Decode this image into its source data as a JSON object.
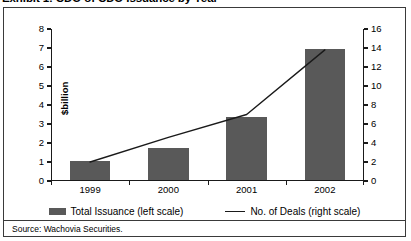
{
  "exhibit": {
    "title": "Exhibit 1: CDO of CDO Issuance by Year",
    "source": "Source: Wachovia Securities."
  },
  "chart_data": {
    "type": "bar",
    "title": "Exhibit 1: CDO of CDO Issuance by Year",
    "categories": [
      "1999",
      "2000",
      "2001",
      "2002"
    ],
    "xlabel": "",
    "ylabel": "$billion",
    "ylim": [
      0,
      8
    ],
    "yticks": [
      "0",
      "1",
      "2",
      "3",
      "4",
      "5",
      "6",
      "7",
      "8"
    ],
    "y2label": "",
    "y2lim": [
      0,
      16
    ],
    "y2ticks": [
      "0",
      "2",
      "4",
      "6",
      "8",
      "10",
      "12",
      "14",
      "16"
    ],
    "grid": false,
    "legend_position": "bottom",
    "series": [
      {
        "name": "Total Issuance (left scale)",
        "type": "bar",
        "axis": "left",
        "color": "#595959",
        "values": [
          1.0,
          1.7,
          3.3,
          6.9
        ]
      },
      {
        "name": "No. of Deals (right scale)",
        "type": "line",
        "axis": "right",
        "color": "#1a1a1a",
        "values": [
          2.0,
          4.6,
          7.0,
          13.8
        ]
      }
    ]
  }
}
